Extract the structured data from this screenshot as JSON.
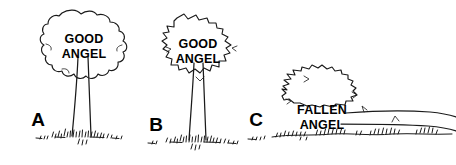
{
  "figure": {
    "background_color": "#ffffff",
    "ink_color": "#1a1a1a",
    "style": "hand-drawn black line art illustration",
    "width": 456,
    "height": 165
  },
  "panels": [
    {
      "letter": "A",
      "label_line1": "GOOD",
      "label_line2": "ANGEL",
      "subject": "upright-tree-rounded-crown",
      "state": "standing"
    },
    {
      "letter": "B",
      "label_line1": "GOOD",
      "label_line2": "ANGEL",
      "subject": "upright-tree-jagged-crown",
      "state": "standing"
    },
    {
      "letter": "C",
      "label_line1": "FALLEN",
      "label_line2": "ANGEL",
      "subject": "fallen-tree-on-side",
      "state": "fallen"
    }
  ]
}
